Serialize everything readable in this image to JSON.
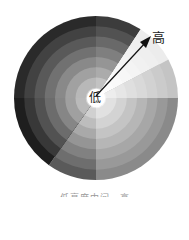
{
  "diagram": {
    "type": "radial-gradient-wheel",
    "center_label": "低",
    "outer_label": "高",
    "caption": "低亮度中间，高",
    "arrow": {
      "from": "center",
      "to": "outer",
      "direction": "top-right"
    },
    "rings": 8,
    "sectors": [
      {
        "start": 0,
        "end": 33,
        "inner": "#d8d8d8",
        "outer": "#3c3c3c"
      },
      {
        "start": 33,
        "end": 62,
        "inner": "#ffffff",
        "outer": "#ececec"
      },
      {
        "start": 62,
        "end": 90,
        "inner": "#f4f4f4",
        "outer": "#c4c4c4"
      },
      {
        "start": 90,
        "end": 180,
        "inner": "#f0f0f0",
        "outer": "#8a8a8a"
      },
      {
        "start": 180,
        "end": 215,
        "inner": "#e4e4e4",
        "outer": "#5a5a5a"
      },
      {
        "start": 215,
        "end": 270,
        "inner": "#d4d4d4",
        "outer": "#1e1e1e"
      },
      {
        "start": 270,
        "end": 360,
        "inner": "#d0d0d0",
        "outer": "#2a2a2a"
      }
    ]
  }
}
